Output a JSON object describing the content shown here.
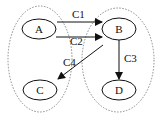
{
  "diagram": {
    "groups": [
      {
        "id": "left-group",
        "members": [
          "A",
          "C"
        ],
        "style": "dotted"
      },
      {
        "id": "right-group",
        "members": [
          "B",
          "D"
        ],
        "style": "dotted"
      }
    ],
    "nodes": [
      {
        "id": "A",
        "label": "A"
      },
      {
        "id": "B",
        "label": "B"
      },
      {
        "id": "C",
        "label": "C"
      },
      {
        "id": "D",
        "label": "D"
      }
    ],
    "edges": [
      {
        "id": "C1",
        "label": "C1",
        "from": "A",
        "to": "B"
      },
      {
        "id": "C2",
        "label": "C2",
        "from": "A",
        "to": "B"
      },
      {
        "id": "C3",
        "label": "C3",
        "from": "B",
        "to": "D"
      },
      {
        "id": "C4",
        "label": "C4",
        "from": "B",
        "to": "C"
      }
    ],
    "colors": {
      "stroke": "#111111",
      "group_stroke": "#888888",
      "background": "#ffffff"
    }
  }
}
